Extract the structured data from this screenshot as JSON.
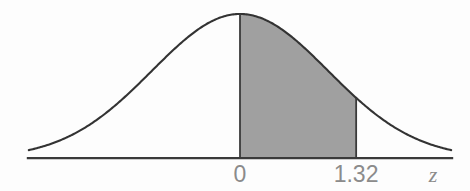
{
  "figure": {
    "kind": "normal-distribution-shaded-area",
    "background_color": "#fdfdfd",
    "curve_color": "#333333",
    "axis_color": "#3a3a3a",
    "shade_color": "#a0a0a0",
    "label_color": "#8b8b8b"
  },
  "axis": {
    "name": "z",
    "tick_labels": [
      "0",
      "1.32"
    ]
  },
  "labels": {
    "zero": "0",
    "z_value": "1.32",
    "axis_variable": "z"
  },
  "chart_data": {
    "type": "area",
    "title": "",
    "subtitle": "",
    "xlabel": "z",
    "ylabel": "",
    "grid": false,
    "legend": null,
    "distribution": "standard normal",
    "mean": 0,
    "sd": 1,
    "xlim": [
      -2.4,
      2.4
    ],
    "ylim": [
      0,
      0.4
    ],
    "xticks": [
      0,
      1.32
    ],
    "xtick_labels": [
      "0",
      "1.32"
    ],
    "shaded_region": {
      "from": 0,
      "to": 1.32,
      "fill": "#a0a0a0",
      "boundary_lines": [
        0,
        1.32
      ]
    },
    "x": [
      -2.4,
      -2.2,
      -2.0,
      -1.8,
      -1.6,
      -1.4,
      -1.2,
      -1.0,
      -0.8,
      -0.6,
      -0.4,
      -0.2,
      0.0,
      0.2,
      0.4,
      0.6,
      0.8,
      1.0,
      1.2,
      1.32,
      1.4,
      1.6,
      1.8,
      2.0,
      2.2,
      2.4
    ],
    "y": [
      0.0224,
      0.0355,
      0.054,
      0.079,
      0.1109,
      0.1497,
      0.1942,
      0.242,
      0.2897,
      0.3332,
      0.3683,
      0.391,
      0.3989,
      0.391,
      0.3683,
      0.3332,
      0.2897,
      0.242,
      0.1942,
      0.1669,
      0.1497,
      0.1109,
      0.079,
      0.054,
      0.0355,
      0.0224
    ]
  }
}
